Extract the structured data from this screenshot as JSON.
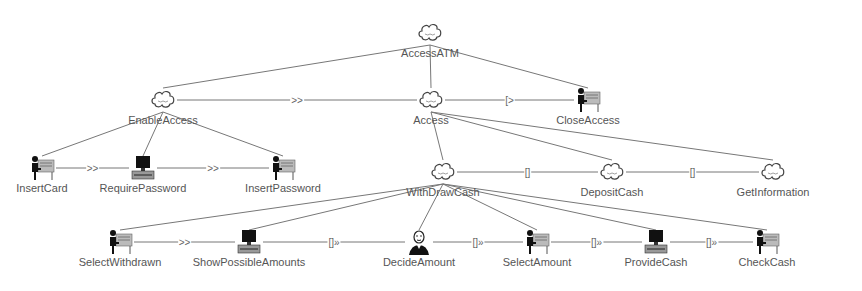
{
  "diagram": {
    "type": "task-model-tree",
    "nodes": [
      {
        "id": "AccessATM",
        "label": "AccessATM",
        "icon": "abstract-task-cloud-icon",
        "x": 430,
        "y": 33
      },
      {
        "id": "EnableAccess",
        "label": "EnableAccess",
        "icon": "abstract-task-cloud-icon",
        "x": 163,
        "y": 100
      },
      {
        "id": "Access",
        "label": "Access",
        "icon": "abstract-task-cloud-icon",
        "x": 431,
        "y": 100
      },
      {
        "id": "CloseAccess",
        "label": "CloseAccess",
        "icon": "user-interaction-icon",
        "x": 588,
        "y": 100
      },
      {
        "id": "InsertCard",
        "label": "InsertCard",
        "icon": "user-interaction-icon",
        "x": 42,
        "y": 168
      },
      {
        "id": "RequirePassword",
        "label": "RequirePassword",
        "icon": "computer-application-icon",
        "x": 143,
        "y": 168
      },
      {
        "id": "InsertPassword",
        "label": "InsertPassword",
        "icon": "user-interaction-icon",
        "x": 283,
        "y": 168
      },
      {
        "id": "WithDrawCash",
        "label": "WithDrawCash",
        "icon": "abstract-task-cloud-icon",
        "x": 443,
        "y": 172
      },
      {
        "id": "DepositCash",
        "label": "DepositCash",
        "icon": "abstract-task-cloud-icon",
        "x": 612,
        "y": 172
      },
      {
        "id": "GetInformation",
        "label": "GetInformation",
        "icon": "abstract-task-cloud-icon",
        "x": 773,
        "y": 172
      },
      {
        "id": "SelectWithdrawn",
        "label": "SelectWithdrawn",
        "icon": "user-interaction-icon",
        "x": 120,
        "y": 242
      },
      {
        "id": "ShowPossibleAmounts",
        "label": "ShowPossibleAmounts",
        "icon": "computer-application-icon",
        "x": 249,
        "y": 242
      },
      {
        "id": "DecideAmount",
        "label": "DecideAmount",
        "icon": "user-cognitive-task-icon",
        "x": 419,
        "y": 242
      },
      {
        "id": "SelectAmount",
        "label": "SelectAmount",
        "icon": "user-interaction-icon",
        "x": 537,
        "y": 242
      },
      {
        "id": "ProvideCash",
        "label": "ProvideCash",
        "icon": "computer-application-icon",
        "x": 656,
        "y": 242
      },
      {
        "id": "CheckCash",
        "label": "CheckCash",
        "icon": "user-interaction-icon",
        "x": 767,
        "y": 242
      }
    ],
    "hierarchy_edges": [
      [
        "AccessATM",
        "EnableAccess"
      ],
      [
        "AccessATM",
        "Access"
      ],
      [
        "AccessATM",
        "CloseAccess"
      ],
      [
        "EnableAccess",
        "InsertCard"
      ],
      [
        "EnableAccess",
        "RequirePassword"
      ],
      [
        "EnableAccess",
        "InsertPassword"
      ],
      [
        "Access",
        "WithDrawCash"
      ],
      [
        "Access",
        "DepositCash"
      ],
      [
        "Access",
        "GetInformation"
      ],
      [
        "WithDrawCash",
        "SelectWithdrawn"
      ],
      [
        "WithDrawCash",
        "ShowPossibleAmounts"
      ],
      [
        "WithDrawCash",
        "DecideAmount"
      ],
      [
        "WithDrawCash",
        "SelectAmount"
      ],
      [
        "WithDrawCash",
        "ProvideCash"
      ],
      [
        "WithDrawCash",
        "CheckCash"
      ]
    ],
    "operator_edges": [
      {
        "from": "EnableAccess",
        "to": "Access",
        "operator": ">>"
      },
      {
        "from": "Access",
        "to": "CloseAccess",
        "operator": "[>"
      },
      {
        "from": "InsertCard",
        "to": "RequirePassword",
        "operator": ">>"
      },
      {
        "from": "RequirePassword",
        "to": "InsertPassword",
        "operator": ">>"
      },
      {
        "from": "WithDrawCash",
        "to": "DepositCash",
        "operator": "[]"
      },
      {
        "from": "DepositCash",
        "to": "GetInformation",
        "operator": "[]"
      },
      {
        "from": "SelectWithdrawn",
        "to": "ShowPossibleAmounts",
        "operator": ">>"
      },
      {
        "from": "ShowPossibleAmounts",
        "to": "DecideAmount",
        "operator": "[]»"
      },
      {
        "from": "DecideAmount",
        "to": "SelectAmount",
        "operator": "[]»"
      },
      {
        "from": "SelectAmount",
        "to": "ProvideCash",
        "operator": "[]»"
      },
      {
        "from": "ProvideCash",
        "to": "CheckCash",
        "operator": "[]»"
      }
    ],
    "colors": {
      "edge": "#777777",
      "label": "#555555",
      "background": "#ffffff"
    }
  }
}
